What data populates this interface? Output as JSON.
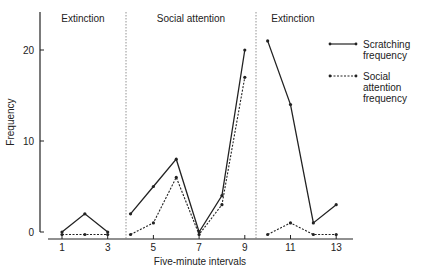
{
  "chart_data": {
    "type": "line",
    "title": "",
    "xlabel": "Five-minute intervals",
    "ylabel": "Frequency",
    "x": [
      1,
      2,
      3,
      4,
      5,
      6,
      7,
      8,
      9,
      10,
      11,
      12,
      13
    ],
    "xticks": [
      1,
      3,
      5,
      7,
      9,
      11,
      13
    ],
    "yticks": [
      0,
      10,
      20
    ],
    "ylim": [
      0,
      23
    ],
    "xlim": [
      0.4,
      13.7
    ],
    "grid": false,
    "legend_position": "right",
    "phases": [
      {
        "label": "Extinction",
        "x_start": 0.4,
        "x_end": 3.5,
        "points": [
          1,
          2,
          3
        ]
      },
      {
        "label": "Social attention",
        "x_start": 3.5,
        "x_end": 9.5,
        "points": [
          4,
          5,
          6,
          7,
          8,
          9
        ]
      },
      {
        "label": "Extinction",
        "x_start": 9.5,
        "x_end": 13.7,
        "points": [
          10,
          11,
          12,
          13
        ]
      }
    ],
    "series": [
      {
        "name": "Scratching frequency",
        "style": "solid",
        "segments": [
          {
            "x": [
              1,
              2,
              3
            ],
            "values": [
              0,
              2,
              0
            ]
          },
          {
            "x": [
              4,
              5,
              6,
              7,
              8,
              9
            ],
            "values": [
              2,
              5,
              8,
              0,
              4,
              20
            ]
          },
          {
            "x": [
              10,
              11,
              12,
              13
            ],
            "values": [
              21,
              14,
              1,
              3
            ]
          }
        ]
      },
      {
        "name": "Social attention frequency",
        "style": "dashed",
        "segments": [
          {
            "x": [
              1,
              2,
              3
            ],
            "values": [
              0,
              0,
              0
            ]
          },
          {
            "x": [
              4,
              5,
              6,
              7,
              8,
              9
            ],
            "values": [
              0,
              1,
              6,
              0,
              3,
              17
            ]
          },
          {
            "x": [
              10,
              11,
              12,
              13
            ],
            "values": [
              0,
              1,
              0,
              0
            ]
          }
        ]
      }
    ]
  },
  "legend": {
    "items": [
      {
        "lines": [
          "Scratching",
          "frequency"
        ]
      },
      {
        "lines": [
          "Social",
          "attention",
          "frequency"
        ]
      }
    ]
  },
  "colors": {
    "line": "#222222",
    "separator": "#777777"
  }
}
